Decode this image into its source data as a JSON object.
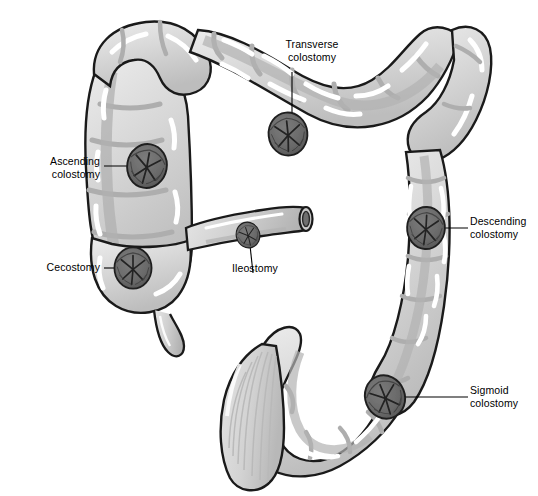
{
  "figure": {
    "background_color": "#ffffff",
    "line_color": "#1a1a1a"
  },
  "palette": {
    "colon_fill": "#d2d2d2",
    "colon_fill_light": "#dcdcdc",
    "colon_highlight": "#ffffff",
    "colon_shadow": "#b4b4b4",
    "colon_deep_shadow": "#a0a0a0",
    "stoma_fill": "#6d6d6d",
    "stoma_dark": "#4a4a4a",
    "stoma_outline": "#1f1f1f",
    "outline": "#1a1a1a",
    "leader_line": "#000000",
    "text": "#000000"
  },
  "labels": [
    {
      "id": "transverse-colostomy",
      "text": "Transverse\ncolostomy",
      "align": "center",
      "x": 257,
      "y": 38,
      "width": 110
    },
    {
      "id": "ascending-colostomy",
      "text": "Ascending\ncolostomy",
      "align": "right",
      "x": 8,
      "y": 155,
      "width": 92
    },
    {
      "id": "cecostomy",
      "text": "Cecostomy",
      "align": "right",
      "x": 8,
      "y": 259,
      "width": 92
    },
    {
      "id": "ileostomy",
      "text": "Ileostomy",
      "align": "left",
      "x": 232,
      "y": 261,
      "width": 90
    },
    {
      "id": "descending-colostomy",
      "text": "Descending\ncolostomy",
      "align": "left",
      "x": 470,
      "y": 218,
      "width": 96
    },
    {
      "id": "sigmoid-colostomy",
      "text": "Sigmoid\ncolostomy",
      "align": "left",
      "x": 470,
      "y": 385,
      "width": 96
    }
  ],
  "stomas": [
    {
      "id": "transverse",
      "label": "Transverse colostomy",
      "cx": 288,
      "cy": 134,
      "rx": 26,
      "ry": 23,
      "rotate": -6
    },
    {
      "id": "ascending",
      "label": "Ascending colostomy",
      "cx": 147,
      "cy": 166,
      "rx": 22,
      "ry": 25,
      "rotate": 10
    },
    {
      "id": "cecostomy",
      "label": "Cecostomy",
      "cx": 133,
      "cy": 268,
      "rx": 22,
      "ry": 22,
      "rotate": 0
    },
    {
      "id": "ileostomy",
      "label": "Ileostomy",
      "cx": 248,
      "cy": 235,
      "rx": 13,
      "ry": 16,
      "rotate": -18
    },
    {
      "id": "descending",
      "label": "Descending colostomy",
      "cx": 426,
      "cy": 228,
      "rx": 21,
      "ry": 26,
      "rotate": 3
    },
    {
      "id": "sigmoid",
      "label": "Sigmoid colostomy",
      "cx": 385,
      "cy": 397,
      "rx": 22,
      "ry": 25,
      "rotate": -22
    }
  ],
  "leader_lines": [
    {
      "id": "transverse-leader",
      "points": "292,72 292,134"
    },
    {
      "id": "ascending-leader",
      "points": "104,166 147,166"
    },
    {
      "id": "cecostomy-leader",
      "points": "104,268 133,268"
    },
    {
      "id": "ileostomy-leader",
      "points": "249,236 253,273"
    },
    {
      "id": "descending-leader",
      "points": "426,228 468,228"
    },
    {
      "id": "sigmoid-leader",
      "points": "388,397 468,397"
    }
  ],
  "anatomy": [
    {
      "id": "cecum",
      "name": "cecum"
    },
    {
      "id": "appendix",
      "name": "vermiform appendix"
    },
    {
      "id": "ascending-colon",
      "name": "ascending colon"
    },
    {
      "id": "hepatic-flexure",
      "name": "hepatic flexure"
    },
    {
      "id": "transverse-colon",
      "name": "transverse colon"
    },
    {
      "id": "splenic-flexure",
      "name": "splenic flexure"
    },
    {
      "id": "descending-colon",
      "name": "descending colon"
    },
    {
      "id": "sigmoid-colon",
      "name": "sigmoid colon"
    },
    {
      "id": "rectum",
      "name": "rectum"
    },
    {
      "id": "ileum",
      "name": "ileum"
    }
  ]
}
